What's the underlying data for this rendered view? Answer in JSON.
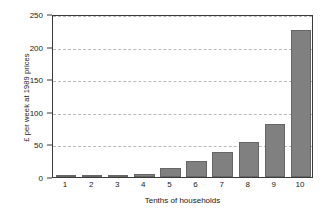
{
  "chart_data": {
    "type": "bar",
    "title": "",
    "subtitle": "",
    "xlabel": "Tenths of households",
    "ylabel": "£ per week at 1989 prices",
    "categories": [
      "1",
      "2",
      "3",
      "4",
      "5",
      "6",
      "7",
      "8",
      "9",
      "10"
    ],
    "values": [
      0.5,
      1,
      2,
      5,
      14,
      25,
      38,
      54,
      81,
      226
    ],
    "ylim": [
      0,
      250
    ],
    "y_ticks": [
      0,
      50,
      100,
      150,
      200,
      250
    ],
    "y_tick_labels": [
      "0",
      "50",
      "100",
      "150",
      "200",
      "250"
    ],
    "grid": true,
    "grid_axis": "y",
    "grid_style": "dashed",
    "legend": false,
    "legend_position": "none",
    "bar_color": "#808080",
    "bar_edge_color": "#666666",
    "axis_color": "#3a3a3a",
    "grid_color": "#b9b9b9",
    "text_color": "#1a1a1a",
    "background_color": "#ffffff"
  }
}
